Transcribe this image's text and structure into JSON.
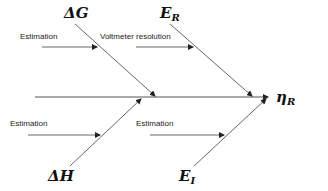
{
  "diagram": {
    "type": "fishbone",
    "effect": {
      "symbol": "η",
      "subscript": "R"
    },
    "causes": [
      {
        "id": "dG",
        "symbol": "ΔG",
        "subscript": "",
        "position": "top",
        "sub_cause": "Estimation"
      },
      {
        "id": "ER",
        "symbol": "E",
        "subscript": "R",
        "position": "top",
        "sub_cause": "Voltmeter resolution"
      },
      {
        "id": "dH",
        "symbol": "ΔH",
        "subscript": "",
        "position": "bottom",
        "sub_cause": "Estimation"
      },
      {
        "id": "EI",
        "symbol": "E",
        "subscript": "I",
        "position": "bottom",
        "sub_cause": "Estimation"
      }
    ],
    "colors": {
      "lines": "#555555",
      "text": "#111111"
    }
  }
}
